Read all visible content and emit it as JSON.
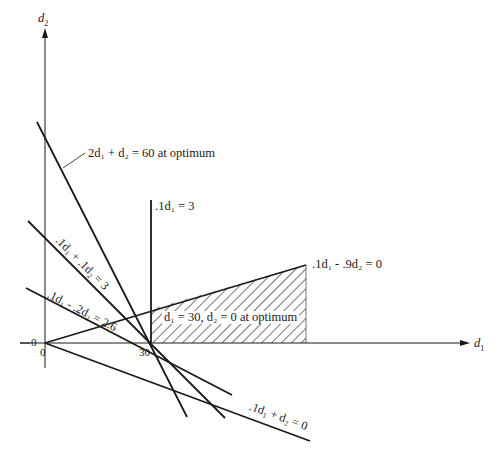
{
  "figure": {
    "type": "linear-programming-graph",
    "axes": {
      "x_label": "d1",
      "y_label": "d2",
      "origin_label_x": "0",
      "origin_label_y": "0",
      "tick_x_30": "30"
    },
    "constraint_lines": [
      {
        "id": "objective",
        "label": "2d1 + d2 = 60 at optimum",
        "display": "2d₁ + d₂ = 60 at optimum"
      },
      {
        "id": "c1",
        "label": ".1d1 = 3",
        "display": ".1d₁ = 3"
      },
      {
        "id": "c2",
        "label": ".1d1 + .1d2 = 3",
        "display": ".1d₁ + .1d₂ = 3"
      },
      {
        "id": "c3",
        "label": ".1d1 - .2d2 = 2.6",
        "display": ".1d₁ - .2d₂ = 2.6"
      },
      {
        "id": "c4",
        "label": ".1d1 - .9d2 = 0",
        "display": ".1d₁ - .9d₂ = 0"
      },
      {
        "id": "c5",
        "label": ".1d1 + d2 = 0",
        "display": ".1d₁ + d₂ = 0"
      }
    ],
    "feasible_region": {
      "label": "d1 = 30, d2 = 0 at optimum",
      "display": "d₁ = 30, d₂ = 0 at optimum",
      "pattern": "diagonal-hatch"
    },
    "optimum_point": {
      "d1": 30,
      "d2": 0
    },
    "colors": {
      "ink": "#1a1a1a",
      "background": "#ffffff"
    }
  }
}
